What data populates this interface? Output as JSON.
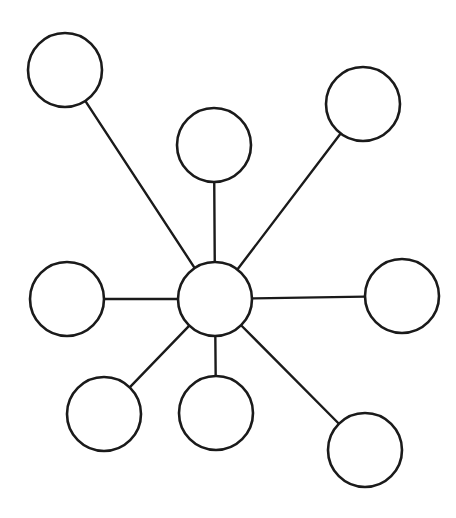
{
  "diagram": {
    "type": "star-network",
    "colors": {
      "stroke": "#1a1a1a",
      "fill": "#ffffff",
      "background": "#ffffff"
    },
    "hub": {
      "id": "hub",
      "label": ""
    },
    "nodes": [
      {
        "id": "top-left",
        "label": ""
      },
      {
        "id": "top-center",
        "label": ""
      },
      {
        "id": "top-right",
        "label": ""
      },
      {
        "id": "left",
        "label": ""
      },
      {
        "id": "right",
        "label": ""
      },
      {
        "id": "bottom-left",
        "label": ""
      },
      {
        "id": "bottom-center",
        "label": ""
      },
      {
        "id": "bottom-right",
        "label": ""
      }
    ],
    "edges": [
      {
        "from": "hub",
        "to": "top-left"
      },
      {
        "from": "hub",
        "to": "top-center"
      },
      {
        "from": "hub",
        "to": "top-right"
      },
      {
        "from": "hub",
        "to": "left"
      },
      {
        "from": "hub",
        "to": "right"
      },
      {
        "from": "hub",
        "to": "bottom-left"
      },
      {
        "from": "hub",
        "to": "bottom-center"
      },
      {
        "from": "hub",
        "to": "bottom-right"
      }
    ]
  }
}
